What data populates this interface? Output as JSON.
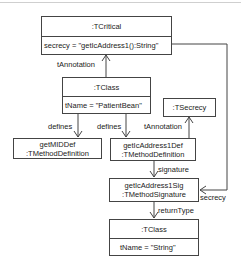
{
  "diagram": {
    "type": "uml-object-diagram",
    "line_color": "#444444",
    "background": "#ffffff",
    "nodes": {
      "tcritical": {
        "title": ":TCritical",
        "attr": "secrecy = \"getIcAddress1():String\""
      },
      "tclass_patient": {
        "title": ":TClass",
        "attr": "tName = \"PatientBean\""
      },
      "tsecrecy": {
        "title": ":TSecrecy"
      },
      "getmid_def": {
        "line1": "getMIDDef",
        "line2": ":TMethodDefinition"
      },
      "address_def": {
        "line1": "getIcAddress1Def",
        "line2": ":TMethodDefinition"
      },
      "address_sig": {
        "line1": "getIcAddress1Sig",
        "line2": ":TMethodSignature"
      },
      "tclass_string": {
        "title": ":TClass",
        "attr": "tName = \"String\""
      }
    },
    "edges": {
      "tannotation_1": "tAnnotation",
      "defines_1": "defines",
      "defines_2": "defines",
      "tannotation_2": "tAnnotation",
      "signature": "signature",
      "secrecy": "secrecy",
      "returntype": "returnType"
    }
  }
}
